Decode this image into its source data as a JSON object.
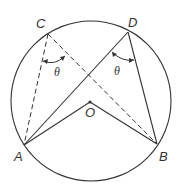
{
  "diagram": {
    "type": "geometry",
    "colors": {
      "stroke": "#333333",
      "background": "#ffffff"
    },
    "circle": {
      "center_label": "O"
    },
    "points": {
      "A": {
        "label": "A"
      },
      "B": {
        "label": "B"
      },
      "C": {
        "label": "C"
      },
      "D": {
        "label": "D"
      },
      "O": {
        "label": "O"
      }
    },
    "angles": [
      {
        "vertex": "C",
        "label": "θ",
        "lines": "dashed"
      },
      {
        "vertex": "D",
        "label": "θ",
        "lines": "solid"
      }
    ],
    "segments": [
      {
        "from": "C",
        "to": "A",
        "style": "dashed"
      },
      {
        "from": "C",
        "to": "B",
        "style": "dashed"
      },
      {
        "from": "D",
        "to": "A",
        "style": "solid"
      },
      {
        "from": "D",
        "to": "B",
        "style": "solid"
      },
      {
        "from": "O",
        "to": "A",
        "style": "solid"
      },
      {
        "from": "O",
        "to": "B",
        "style": "solid"
      }
    ]
  }
}
